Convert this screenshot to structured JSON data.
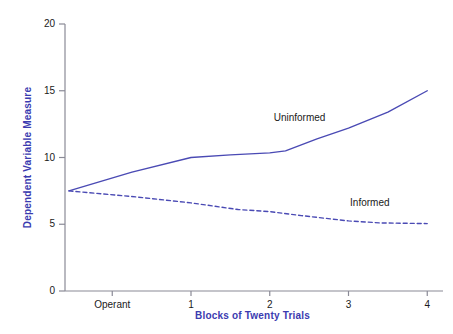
{
  "chart_data": {
    "type": "line",
    "title": "",
    "xlabel": "Blocks of Twenty Trials",
    "ylabel": "Dependent Variable Measure",
    "x_tick_labels": [
      "Operant",
      "1",
      "2",
      "3",
      "4"
    ],
    "y_tick_labels": [
      "0",
      "5",
      "10",
      "15",
      "20"
    ],
    "y_ticks": [
      0,
      5,
      10,
      15,
      20
    ],
    "ylim": [
      0,
      20
    ],
    "xlim": [
      -0.6,
      4.2
    ],
    "grid": false,
    "legend_position": "inline-annotation",
    "series": [
      {
        "name": "Uninformed",
        "style": "solid",
        "color": "#4a4ab4",
        "x": [
          -0.55,
          0.25,
          1.0,
          1.5,
          2.0,
          2.2,
          2.6,
          3.0,
          3.5,
          4.0
        ],
        "values": [
          7.5,
          8.9,
          10.0,
          10.2,
          10.35,
          10.5,
          11.4,
          12.2,
          13.4,
          15.0
        ]
      },
      {
        "name": "Informed",
        "style": "dashed",
        "color": "#4a4ab4",
        "x": [
          -0.55,
          0.3,
          1.0,
          1.6,
          2.0,
          2.4,
          3.0,
          3.4,
          4.0
        ],
        "values": [
          7.5,
          7.05,
          6.6,
          6.1,
          5.95,
          5.65,
          5.25,
          5.1,
          5.05
        ]
      }
    ],
    "annotations": [
      {
        "text": "Uninformed",
        "x": 2.05,
        "y": 12.9
      },
      {
        "text": "Informed",
        "x": 3.02,
        "y": 6.55
      }
    ],
    "axis_color": "#8a8a96",
    "label_color": "#3b3bb0",
    "tick_color": "#1a1a1a"
  }
}
